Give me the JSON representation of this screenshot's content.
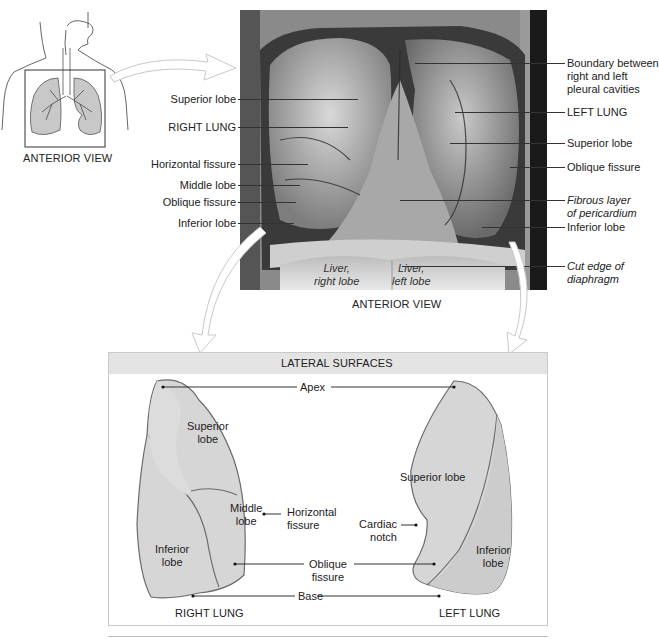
{
  "thumbnail": {
    "caption": "ANTERIOR VIEW"
  },
  "photo": {
    "caption": "ANTERIOR VIEW",
    "overlay_labels": {
      "liver_right": [
        "Liver,",
        "right lobe"
      ],
      "liver_left": [
        "Liver,",
        "left lobe"
      ]
    },
    "left_labels": [
      {
        "text": "Superior lobe"
      },
      {
        "text": "RIGHT LUNG"
      },
      {
        "text": "Horizontal fissure"
      },
      {
        "text": "Middle lobe"
      },
      {
        "text": "Oblique fissure"
      },
      {
        "text": "Inferior lobe"
      }
    ],
    "right_labels": [
      {
        "lines": [
          "Boundary between",
          "right and left",
          "pleural cavities"
        ],
        "italic": false
      },
      {
        "lines": [
          "LEFT LUNG"
        ],
        "italic": false
      },
      {
        "lines": [
          "Superior lobe"
        ],
        "italic": false
      },
      {
        "lines": [
          "Oblique fissure"
        ],
        "italic": false
      },
      {
        "lines": [
          "Fibrous layer",
          "of pericardium"
        ],
        "italic": true
      },
      {
        "lines": [
          "Inferior lobe"
        ],
        "italic": false
      },
      {
        "lines": [
          "Cut edge of",
          "diaphragm"
        ],
        "italic": true
      }
    ]
  },
  "lateral": {
    "header": "LATERAL SURFACES",
    "center_labels": {
      "apex": "Apex",
      "horizontal_fissure": [
        "Horizontal",
        "fissure"
      ],
      "cardiac_notch": [
        "Cardiac",
        "notch"
      ],
      "oblique_fissure": [
        "Oblique",
        "fissure"
      ],
      "base": "Base"
    },
    "right_lung": {
      "caption": "RIGHT LUNG",
      "superior": [
        "Superior",
        "lobe"
      ],
      "middle": [
        "Middle",
        "lobe"
      ],
      "inferior": [
        "Inferior",
        "lobe"
      ]
    },
    "left_lung": {
      "caption": "LEFT LUNG",
      "superior": "Superior lobe",
      "inferior": [
        "Inferior",
        "lobe"
      ]
    }
  },
  "colors": {
    "header_bg": "#e4e4e4",
    "box_border": "#c9c9c9",
    "lung_fill": "#d6d6d6",
    "lung_stroke": "#6b6b6b",
    "arrow": "#cfcfcf"
  }
}
